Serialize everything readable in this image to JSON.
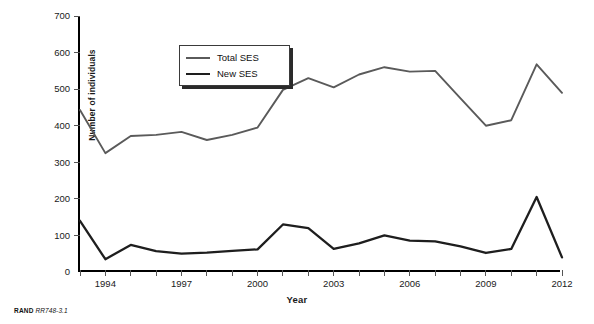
{
  "figure": {
    "source_note_brand": "RAND",
    "source_note_code": "RR748-3.1"
  },
  "chart_data": {
    "type": "line",
    "title": "",
    "xlabel": "Year",
    "ylabel": "Number of individuals",
    "xlim": [
      1993,
      2012
    ],
    "ylim": [
      0,
      700
    ],
    "ytick_labels": [
      "0",
      "100",
      "200",
      "300",
      "400",
      "500",
      "600",
      "700"
    ],
    "ytick_values": [
      0,
      100,
      200,
      300,
      400,
      500,
      600,
      700
    ],
    "xtick_values": [
      1993,
      1994,
      1995,
      1996,
      1997,
      1998,
      1999,
      2000,
      2001,
      2002,
      2003,
      2004,
      2005,
      2006,
      2007,
      2008,
      2009,
      2010,
      2011,
      2012
    ],
    "xtick_labels": [
      "",
      "1994",
      "",
      "",
      "1997",
      "",
      "",
      "2000",
      "",
      "",
      "2003",
      "",
      "",
      "2006",
      "",
      "",
      "2009",
      "",
      "",
      "2012"
    ],
    "grid": false,
    "legend_position": "upper-left",
    "x": [
      1993,
      1994,
      1995,
      1996,
      1997,
      1998,
      1999,
      2000,
      2001,
      2002,
      2003,
      2004,
      2005,
      2006,
      2007,
      2008,
      2009,
      2010,
      2011,
      2012
    ],
    "series": [
      {
        "name": "Total SES",
        "color": "#5a5a5a",
        "width": 1.9,
        "values": [
          443,
          325,
          372,
          375,
          383,
          361,
          375,
          395,
          498,
          530,
          505,
          540,
          560,
          548,
          550,
          475,
          400,
          415,
          568,
          490
        ]
      },
      {
        "name": "New SES",
        "color": "#1e1e1e",
        "width": 2.3,
        "values": [
          140,
          35,
          74,
          57,
          50,
          53,
          58,
          62,
          130,
          120,
          63,
          78,
          100,
          86,
          84,
          70,
          52,
          63,
          205,
          40
        ]
      }
    ]
  }
}
